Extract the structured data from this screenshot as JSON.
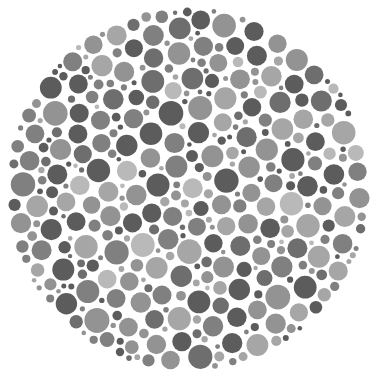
{
  "plate": {
    "type": "ishihara-style dot plate (grayscale)",
    "background": "#ffffff",
    "center": [
      188,
      189
    ],
    "radius": 182,
    "palette": [
      "#5c5c5c",
      "#6e6e6e",
      "#808080",
      "#939393",
      "#a6a6a6",
      "#b9b9b9"
    ],
    "palette_weights": [
      0.24,
      0.16,
      0.18,
      0.24,
      0.14,
      0.04
    ],
    "dot_radius_min": 2.2,
    "dot_radius_max": 12.5,
    "dot_gap": 1.6,
    "attempts": 60000,
    "seed": 7
  }
}
